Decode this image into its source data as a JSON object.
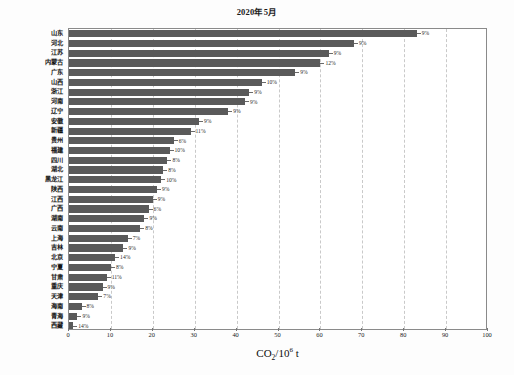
{
  "chart_data": {
    "type": "bar",
    "orientation": "horizontal",
    "title": "2020年5月",
    "xlabel": "CO2/10^6 t",
    "xlabel_parts": {
      "base": "CO",
      "sub": "2",
      "slash": "/10",
      "sup": "6",
      "unit": " t"
    },
    "ylabel": "",
    "xlim": [
      0,
      100
    ],
    "xticks": [
      0,
      10,
      20,
      30,
      40,
      50,
      60,
      70,
      80,
      90,
      100
    ],
    "grid": "vertical-dashed",
    "legend": "none",
    "bar_color": "#5a5a5a",
    "categories": [
      "山东",
      "河北",
      "江苏",
      "内蒙古",
      "广东",
      "山西",
      "浙江",
      "河南",
      "辽宁",
      "安徽",
      "新疆",
      "贵州",
      "福建",
      "四川",
      "湖北",
      "黑龙江",
      "陕西",
      "江西",
      "广西",
      "湖南",
      "云南",
      "上海",
      "吉林",
      "北京",
      "宁夏",
      "甘肃",
      "重庆",
      "天津",
      "海南",
      "青海",
      "西藏"
    ],
    "values": [
      83.0,
      68.0,
      62.0,
      60.0,
      54.0,
      46.0,
      43.0,
      42.0,
      38.0,
      31.0,
      29.0,
      25.0,
      24.0,
      23.5,
      22.5,
      22.0,
      21.0,
      20.0,
      19.0,
      18.0,
      17.0,
      14.0,
      13.0,
      11.0,
      10.0,
      9.0,
      8.0,
      7.0,
      3.0,
      2.0,
      1.0
    ],
    "annotations": [
      "9%",
      "9%",
      "9%",
      "12%",
      "9%",
      "10%",
      "9%",
      "9%",
      "9%",
      "9%",
      "11%",
      "6%",
      "10%",
      "8%",
      "8%",
      "10%",
      "9%",
      "9%",
      "6%",
      "9%",
      "8%",
      "7%",
      "9%",
      "14%",
      "8%",
      "11%",
      "9%",
      "7%",
      "8%",
      "9%",
      "14%"
    ]
  }
}
